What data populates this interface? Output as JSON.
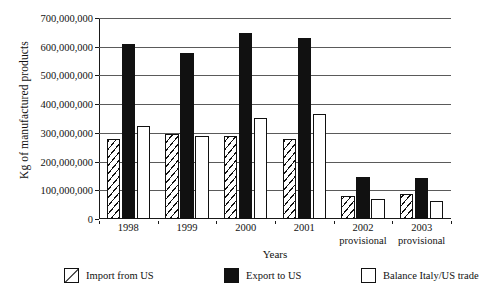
{
  "chart_data": {
    "type": "bar",
    "title": "",
    "xlabel": "Years",
    "ylabel": "Kg of manufactured products",
    "categories": [
      "1998",
      "1999",
      "2000",
      "2001",
      "2002",
      "2003"
    ],
    "category_sublabels": [
      "",
      "",
      "",
      "",
      "provisional",
      "provisional"
    ],
    "ylim": [
      0,
      700000000
    ],
    "ytick_values": [
      0,
      100000000,
      200000000,
      300000000,
      400000000,
      500000000,
      600000000,
      700000000
    ],
    "ytick_labels": [
      "0",
      "100,000,000",
      "200,000,000",
      "300,000,000",
      "400,000,000",
      "500,000,000",
      "600,000,000",
      "700,000,000"
    ],
    "grid": true,
    "grid_axis": "y",
    "legend_position": "bottom",
    "series": [
      {
        "name": "Import from US",
        "fill": "diagonal-hatch",
        "color": "#ffffff",
        "values": [
          280000000,
          295000000,
          288000000,
          277000000,
          80000000,
          87000000
        ]
      },
      {
        "name": "Export to US",
        "fill": "solid-black",
        "color": "#111111",
        "values": [
          608000000,
          578000000,
          647000000,
          632000000,
          145000000,
          142000000
        ]
      },
      {
        "name": "Balance Italy/US trade",
        "fill": "white",
        "color": "#ffffff",
        "values": [
          324000000,
          288000000,
          352000000,
          365000000,
          71000000,
          62000000
        ]
      }
    ]
  },
  "legend": {
    "items": [
      {
        "label": "Import from US",
        "swatch": "hatched-swatch-icon"
      },
      {
        "label": "Export to US",
        "swatch": "black-swatch-icon"
      },
      {
        "label": "Balance Italy/US trade",
        "swatch": "white-swatch-icon"
      }
    ]
  },
  "axes": {
    "y_title": "Kg of manufactured products",
    "x_title": "Years"
  }
}
